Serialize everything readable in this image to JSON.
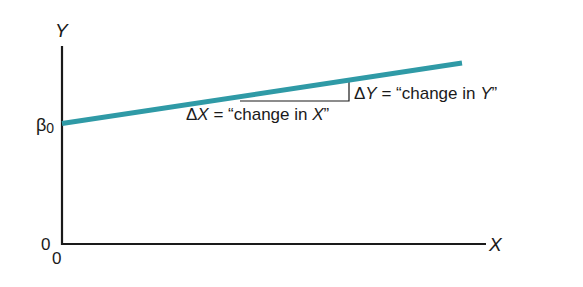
{
  "diagram": {
    "type": "linear-regression-slope",
    "axes": {
      "y_label": "Y",
      "x_label": "X",
      "y_origin_label": "0",
      "x_origin_label": "0"
    },
    "intercept_label": "β",
    "intercept_subscript": "0",
    "line_color": "#2f9aa6",
    "axis_color": "#1a1a1a",
    "delta_x": {
      "symbol": "Δ",
      "var": "X",
      "eq": " = “change in ",
      "var2": "X",
      "close": "”"
    },
    "delta_y": {
      "symbol": "Δ",
      "var": "Y",
      "eq": " = “change in ",
      "var2": "Y",
      "close": "”"
    }
  }
}
